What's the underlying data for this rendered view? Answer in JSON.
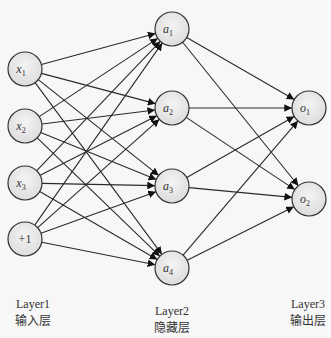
{
  "diagram": {
    "type": "neural-network",
    "layers": [
      {
        "name": "Layer1",
        "caption": "输入层",
        "nodes": [
          {
            "id": "x1",
            "label": "x",
            "sub": "1",
            "cx": 25,
            "cy": 69
          },
          {
            "id": "x2",
            "label": "x",
            "sub": "2",
            "cx": 25,
            "cy": 126
          },
          {
            "id": "x3",
            "label": "x",
            "sub": "3",
            "cx": 25,
            "cy": 183
          },
          {
            "id": "b",
            "label": "+1",
            "sub": "",
            "cx": 25,
            "cy": 239
          }
        ]
      },
      {
        "name": "Layer2",
        "caption": "隐藏层",
        "nodes": [
          {
            "id": "a1",
            "label": "a",
            "sub": "1",
            "cx": 172,
            "cy": 29
          },
          {
            "id": "a2",
            "label": "a",
            "sub": "2",
            "cx": 172,
            "cy": 108
          },
          {
            "id": "a3",
            "label": "a",
            "sub": "3",
            "cx": 172,
            "cy": 186
          },
          {
            "id": "a4",
            "label": "a",
            "sub": "4",
            "cx": 172,
            "cy": 268
          }
        ]
      },
      {
        "name": "Layer3",
        "caption": "输出层",
        "nodes": [
          {
            "id": "o1",
            "label": "o",
            "sub": "1",
            "cx": 309,
            "cy": 108
          },
          {
            "id": "o2",
            "label": "o",
            "sub": "2",
            "cx": 309,
            "cy": 199
          }
        ]
      }
    ],
    "connections": "fully-connected (Layer1→Layer2, Layer2→Layer3), arrows pointing forward",
    "colors": {
      "node_fill": "#e6e6e6",
      "stroke": "#333333",
      "background": "#f7f7f7"
    }
  },
  "labels": {
    "layer1": {
      "name": "Layer1",
      "caption": "输入层"
    },
    "layer2": {
      "name": "Layer2",
      "caption": "隐藏层"
    },
    "layer3": {
      "name": "Layer3",
      "caption": "输出层"
    }
  }
}
